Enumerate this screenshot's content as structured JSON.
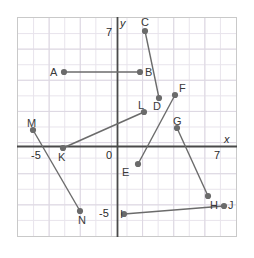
{
  "chart_data": {
    "type": "scatter",
    "title": "",
    "xlabel": "x",
    "ylabel": "y",
    "grid": true,
    "legend": "none",
    "xlim": [
      -7,
      7
    ],
    "ylim": [
      -7,
      7
    ],
    "x_ticks": [
      {
        "value": -5,
        "label": "-5"
      },
      {
        "value": 0,
        "label": "0"
      },
      {
        "value": 7,
        "label": "7"
      }
    ],
    "y_ticks": [
      {
        "value": 7,
        "label": "7"
      },
      {
        "value": -5,
        "label": "-5"
      }
    ],
    "points": [
      {
        "label": "A",
        "x": -3.5,
        "y": 4.0,
        "px": 64,
        "py": 72,
        "lx": 50,
        "ly": 67
      },
      {
        "label": "B",
        "x": 1.5,
        "y": 4.0,
        "px": 140,
        "py": 72,
        "lx": 145,
        "ly": 67
      },
      {
        "label": "C",
        "x": 1.8,
        "y": 7.5,
        "px": 145,
        "py": 31,
        "lx": 141,
        "ly": 17
      },
      {
        "label": "D",
        "x": 2.7,
        "y": 3.1,
        "px": 159,
        "py": 98,
        "lx": 153,
        "ly": 101
      },
      {
        "label": "E",
        "x": 1.4,
        "y": -1.2,
        "px": 138,
        "py": 164,
        "lx": 122,
        "ly": 167
      },
      {
        "label": "F",
        "x": 3.8,
        "y": 3.3,
        "px": 175,
        "py": 95,
        "lx": 179,
        "ly": 83
      },
      {
        "label": "G",
        "x": 3.9,
        "y": 1.2,
        "px": 177,
        "py": 128,
        "lx": 173,
        "ly": 116
      },
      {
        "label": "H",
        "x": 5.9,
        "y": -3.3,
        "px": 208,
        "py": 196,
        "lx": 210,
        "ly": 200
      },
      {
        "label": "I",
        "x": 0.5,
        "y": -5.0,
        "px": 124,
        "py": 214,
        "lx": 120,
        "ly": 209
      },
      {
        "label": "J",
        "x": 6.5,
        "y": -4.3,
        "px": 224,
        "py": 206,
        "lx": 228,
        "ly": 200
      },
      {
        "label": "K",
        "x": -3.5,
        "y": 0.0,
        "px": 63,
        "py": 148,
        "lx": 58,
        "ly": 152
      },
      {
        "label": "L",
        "x": 1.7,
        "y": 2.2,
        "px": 144,
        "py": 112,
        "lx": 138,
        "ly": 100
      },
      {
        "label": "M",
        "x": -5.4,
        "y": 1.1,
        "px": 33,
        "py": 130,
        "lx": 27,
        "ly": 118
      },
      {
        "label": "N",
        "x": -2.4,
        "y": -4.2,
        "px": 80,
        "py": 211,
        "lx": 78,
        "ly": 215
      }
    ],
    "segments": [
      {
        "from": "A",
        "to": "B"
      },
      {
        "from": "C",
        "to": "D"
      },
      {
        "from": "E",
        "to": "F"
      },
      {
        "from": "G",
        "to": "H"
      },
      {
        "from": "I",
        "to": "J"
      },
      {
        "from": "K",
        "to": "L"
      },
      {
        "from": "M",
        "to": "N"
      }
    ],
    "colors": {
      "point": "#6b6b6b",
      "segment": "#6b6b6b",
      "axis": "#4a4a4a",
      "grid_minor": "#e8e4ec",
      "grid_major": "#ddd8e2",
      "text": "#3a3a3a",
      "border": "#c9c9c9"
    }
  },
  "axis_labels": {
    "x_axis_name": "x",
    "y_axis_name": "y",
    "origin": "0",
    "x_neg_five": "-5",
    "x_seven": "7",
    "y_seven": "7",
    "y_neg_five": "-5"
  }
}
